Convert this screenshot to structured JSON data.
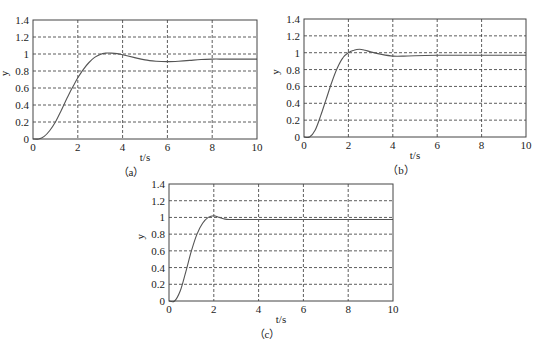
{
  "chart_data": [
    {
      "id": "a",
      "type": "line",
      "caption": "（a）",
      "xlabel": "t/s",
      "ylabel": "y",
      "xlim": [
        0,
        10
      ],
      "ylim": [
        0,
        1.4
      ],
      "xticks": [
        "0",
        "2",
        "4",
        "6",
        "8",
        "10"
      ],
      "yticks": [
        "0",
        "0.2",
        "0.4",
        "0.6",
        "0.8",
        "1",
        "1.2",
        "1.4"
      ],
      "grid": true,
      "series": [
        {
          "name": "step response",
          "x": [
            0,
            0.25,
            0.5,
            0.75,
            1.0,
            1.25,
            1.5,
            1.75,
            2.0,
            2.25,
            2.5,
            2.75,
            3.0,
            3.25,
            3.5,
            3.75,
            4.0,
            4.5,
            5.0,
            5.5,
            6.0,
            6.5,
            7.0,
            7.5,
            8.0,
            8.5,
            9.0,
            9.5,
            10.0
          ],
          "y": [
            0,
            0.0,
            0.03,
            0.1,
            0.2,
            0.33,
            0.47,
            0.6,
            0.72,
            0.82,
            0.9,
            0.96,
            0.995,
            1.01,
            1.01,
            1.005,
            0.99,
            0.96,
            0.93,
            0.915,
            0.91,
            0.915,
            0.925,
            0.935,
            0.94,
            0.94,
            0.94,
            0.94,
            0.94
          ]
        }
      ]
    },
    {
      "id": "b",
      "type": "line",
      "caption": "（b）",
      "xlabel": "t/s",
      "ylabel": "y",
      "xlim": [
        0,
        10
      ],
      "ylim": [
        0,
        1.4
      ],
      "xticks": [
        "0",
        "2",
        "4",
        "6",
        "8",
        "10"
      ],
      "yticks": [
        "0",
        "0.2",
        "0.4",
        "0.6",
        "0.8",
        "1",
        "1.2",
        "1.4"
      ],
      "grid": true,
      "series": [
        {
          "name": "step response",
          "x": [
            0,
            0.25,
            0.5,
            0.75,
            1.0,
            1.25,
            1.5,
            1.75,
            2.0,
            2.25,
            2.5,
            2.75,
            3.0,
            3.5,
            4.0,
            4.5,
            5.0,
            6.0,
            7.0,
            8.0,
            9.0,
            10.0
          ],
          "y": [
            0,
            0.0,
            0.08,
            0.25,
            0.45,
            0.65,
            0.82,
            0.94,
            1.0,
            1.03,
            1.04,
            1.03,
            1.01,
            0.98,
            0.96,
            0.96,
            0.965,
            0.97,
            0.97,
            0.97,
            0.97,
            0.97
          ]
        }
      ]
    },
    {
      "id": "c",
      "type": "line",
      "caption": "（c）",
      "xlabel": "t/s",
      "ylabel": "y",
      "xlim": [
        0,
        10
      ],
      "ylim": [
        0,
        1.4
      ],
      "xticks": [
        "0",
        "2",
        "4",
        "6",
        "8",
        "10"
      ],
      "yticks": [
        "0",
        "0.2",
        "0.4",
        "0.6",
        "0.8",
        "1",
        "1.2",
        "1.4"
      ],
      "grid": true,
      "series": [
        {
          "name": "step response",
          "x": [
            0,
            0.25,
            0.5,
            0.75,
            1.0,
            1.25,
            1.5,
            1.75,
            2.0,
            2.25,
            2.5,
            2.75,
            3.0,
            4.0,
            5.0,
            6.0,
            7.0,
            8.0,
            9.0,
            10.0
          ],
          "y": [
            0,
            0.0,
            0.12,
            0.35,
            0.6,
            0.8,
            0.93,
            1.0,
            1.02,
            1.0,
            0.98,
            0.975,
            0.975,
            0.975,
            0.975,
            0.975,
            0.975,
            0.975,
            0.975,
            0.975
          ]
        }
      ]
    }
  ],
  "layout": {
    "panels": [
      {
        "left": 33,
        "top": 20,
        "right": 257,
        "bottom": 139
      },
      {
        "left": 304,
        "top": 19,
        "right": 526,
        "bottom": 137
      },
      {
        "left": 169,
        "top": 184,
        "right": 393,
        "bottom": 301
      }
    ]
  },
  "colors": {
    "curve": "#555555",
    "grid": "#333333",
    "frame": "#444444",
    "text": "#222222"
  }
}
